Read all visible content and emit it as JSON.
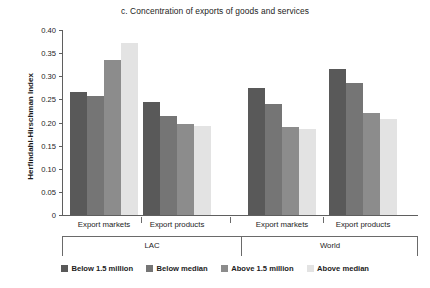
{
  "chart_data": {
    "type": "bar",
    "title": "c. Concentration of exports of goods and services",
    "xlabel": "",
    "ylabel": "Herfindahl-Hirschman Index",
    "ylim": [
      0,
      0.4
    ],
    "yticks": [
      "0",
      "0.05",
      "0.10",
      "0.15",
      "0.20",
      "0.25",
      "0.30",
      "0.35",
      "0.40"
    ],
    "ytick_values": [
      0,
      0.05,
      0.1,
      0.15,
      0.2,
      0.25,
      0.3,
      0.35,
      0.4
    ],
    "grid": false,
    "legend_position": "bottom",
    "categories": [
      "Export markets",
      "Export products",
      "Export markets",
      "Export products"
    ],
    "supergroups": [
      {
        "label": "LAC",
        "span": 2
      },
      {
        "label": "World",
        "span": 2
      }
    ],
    "series": [
      {
        "name": "Below 1.5 million",
        "color": "#595959",
        "values": [
          0.265,
          0.245,
          0.275,
          0.315
        ]
      },
      {
        "name": "Below median",
        "color": "#757575",
        "values": [
          0.258,
          0.215,
          0.24,
          0.285
        ]
      },
      {
        "name": "Above 1.5 million",
        "color": "#8c8c8c",
        "values": [
          0.335,
          0.197,
          0.19,
          0.22
        ]
      },
      {
        "name": "Above median",
        "color": "#e3e3e3",
        "values": [
          0.372,
          0.192,
          0.186,
          0.208
        ]
      }
    ]
  },
  "legend": {
    "items": [
      {
        "label": "Below 1.5 million",
        "color": "#595959"
      },
      {
        "label": "Below median",
        "color": "#757575"
      },
      {
        "label": "Above 1.5 million",
        "color": "#8c8c8c"
      },
      {
        "label": "Above median",
        "color": "#e3e3e3"
      }
    ]
  }
}
